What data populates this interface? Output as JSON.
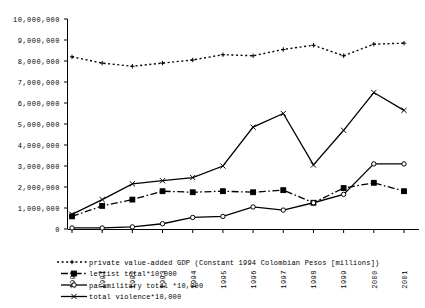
{
  "chart_data": {
    "type": "line",
    "title": "",
    "subtitle": "",
    "xlabel": "",
    "ylabel": "",
    "grid": false,
    "legend_position": "bottom-left",
    "ylim": [
      0,
      10000000
    ],
    "ytick_labels": [
      "10,000,000",
      "9,000,000",
      "8,000,000",
      "7,000,000",
      "6,000,000",
      "5,000,000",
      "4,000,000",
      "3,000,000",
      "2,000,000",
      "1,000,000",
      "0"
    ],
    "ytick_values": [
      10000000,
      9000000,
      8000000,
      7000000,
      6000000,
      5000000,
      4000000,
      3000000,
      2000000,
      1000000,
      0
    ],
    "categories": [
      "1990",
      "1991",
      "1992",
      "1993",
      "1994",
      "1995",
      "1996",
      "1997",
      "1998",
      "1999",
      "2000",
      "2001"
    ],
    "series": [
      {
        "name": "private value-added GDP (Constant 1994 Colombian Pesos [millions])",
        "marker": "plus",
        "style": "dotted",
        "color": "#000000",
        "values": [
          8200000,
          7900000,
          7750000,
          7900000,
          8050000,
          8300000,
          8250000,
          8550000,
          8750000,
          8250000,
          8800000,
          8850000
        ]
      },
      {
        "name": "leftist total*10,000",
        "marker": "filled-square",
        "style": "dash-dot",
        "color": "#000000",
        "values": [
          600000,
          1100000,
          1400000,
          1800000,
          1750000,
          1800000,
          1750000,
          1850000,
          1250000,
          1950000,
          2200000,
          1800000
        ]
      },
      {
        "name": "paramilitary total *10,000",
        "marker": "open-circle",
        "style": "solid",
        "color": "#000000",
        "values": [
          50000,
          50000,
          100000,
          250000,
          550000,
          600000,
          1050000,
          900000,
          1250000,
          1650000,
          3100000,
          3100000
        ]
      },
      {
        "name": "total violence*10,000",
        "marker": "cross",
        "style": "solid",
        "color": "#000000",
        "values": [
          700000,
          1400000,
          2150000,
          2300000,
          2450000,
          3000000,
          4850000,
          5500000,
          3050000,
          4700000,
          6500000,
          5650000
        ]
      }
    ]
  },
  "legend": {
    "entries": [
      {
        "label": "private value-added GDP (Constant 1994 Colombian Pesos [millions])",
        "key": "gdp"
      },
      {
        "label": "leftist total*10,000",
        "key": "leftist"
      },
      {
        "label": "paramilitary total *10,000",
        "key": "paramilitary"
      },
      {
        "label": "total violence*10,000",
        "key": "violence"
      }
    ]
  }
}
